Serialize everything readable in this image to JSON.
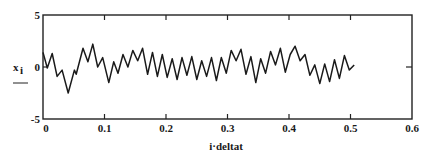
{
  "chart_data": {
    "type": "line",
    "title": "",
    "xlabel": "i·deltat",
    "ylabel": "x_i",
    "xlim": [
      0,
      0.6
    ],
    "ylim": [
      -5,
      5
    ],
    "grid": false,
    "legend": null,
    "x_ticks": [
      "0",
      "0.1",
      "0.2",
      "0.3",
      "0.4",
      "0.5",
      "0.6"
    ],
    "y_ticks": [
      "-5",
      "0",
      "5"
    ],
    "series": [
      {
        "name": "x_i",
        "x": [
          0.0,
          0.007,
          0.015,
          0.023,
          0.031,
          0.041,
          0.051,
          0.054,
          0.065,
          0.073,
          0.081,
          0.089,
          0.097,
          0.107,
          0.115,
          0.122,
          0.13,
          0.138,
          0.146,
          0.154,
          0.162,
          0.17,
          0.178,
          0.186,
          0.194,
          0.202,
          0.21,
          0.218,
          0.226,
          0.234,
          0.242,
          0.25,
          0.258,
          0.266,
          0.274,
          0.282,
          0.29,
          0.298,
          0.306,
          0.314,
          0.322,
          0.33,
          0.338,
          0.346,
          0.354,
          0.362,
          0.37,
          0.378,
          0.386,
          0.394,
          0.402,
          0.41,
          0.418,
          0.426,
          0.434,
          0.442,
          0.45,
          0.458,
          0.466,
          0.474,
          0.482,
          0.49,
          0.498,
          0.506
        ],
        "y": [
          1.4,
          -0.1,
          1.3,
          -0.9,
          -0.3,
          -2.5,
          -0.3,
          -0.7,
          1.8,
          0.5,
          2.2,
          0.0,
          0.9,
          -1.5,
          0.5,
          -0.6,
          1.2,
          0.0,
          1.6,
          0.6,
          1.8,
          -0.7,
          1.4,
          -0.9,
          1.2,
          -1.0,
          0.8,
          -1.2,
          0.9,
          -0.8,
          1.0,
          -1.2,
          0.6,
          -0.9,
          0.9,
          -1.3,
          0.9,
          -0.6,
          1.6,
          0.6,
          1.7,
          -0.7,
          1.0,
          -1.5,
          0.8,
          -0.6,
          1.5,
          0.2,
          1.8,
          -0.5,
          1.2,
          2.0,
          0.6,
          1.2,
          -0.8,
          0.2,
          -1.6,
          0.3,
          -1.4,
          0.7,
          -1.1,
          1.1,
          -0.3,
          0.2
        ]
      }
    ]
  }
}
